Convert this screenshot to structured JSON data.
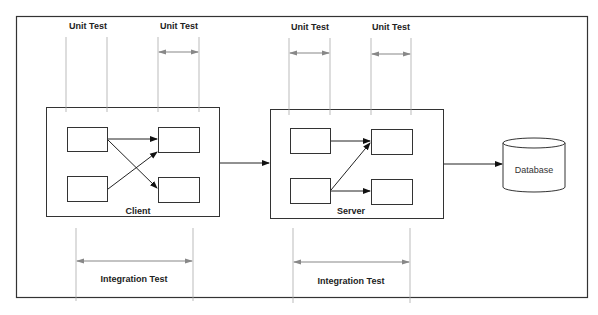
{
  "diagram": {
    "frame": {
      "border_color": "#333333"
    },
    "unit_tests": [
      {
        "label": "Unit Test",
        "has_arrow": false
      },
      {
        "label": "Unit Test",
        "has_arrow": true
      },
      {
        "label": "Unit Test",
        "has_arrow": true
      },
      {
        "label": "Unit Test",
        "has_arrow": true
      }
    ],
    "components": {
      "client": {
        "label": "Client"
      },
      "server": {
        "label": "Server"
      },
      "database": {
        "label": "Database"
      }
    },
    "integration_tests": [
      {
        "label": "Integration Test",
        "scope": "client"
      },
      {
        "label": "Integration Test",
        "scope": "server"
      }
    ],
    "colors": {
      "line": "#222222",
      "guide": "#999999",
      "guide_arrow": "#888888",
      "background": "#ffffff"
    }
  }
}
